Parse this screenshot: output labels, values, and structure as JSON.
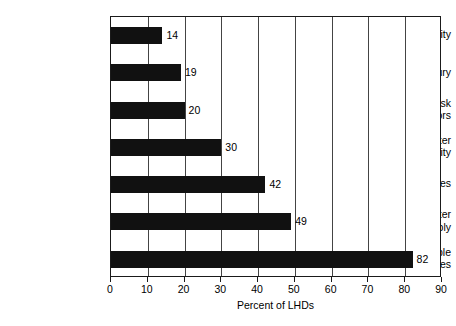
{
  "chart_data": {
    "type": "bar",
    "orientation": "horizontal",
    "title": "",
    "xlabel": "Percent of LHDs",
    "ylabel": "",
    "xlim": [
      0,
      90
    ],
    "xticks": [
      0,
      10,
      20,
      30,
      40,
      50,
      60,
      70,
      80,
      90
    ],
    "grid": "vertical",
    "legend": "none",
    "bar_color": "#111111",
    "categories": [
      "Air quality",
      "Injury",
      "Behavioral risk factors",
      "Recreational water quality",
      "Chronic diseases",
      "Drinking water supply",
      "Communicable diseases"
    ],
    "category_label_lines": [
      [
        "Air quality"
      ],
      [
        "Injury"
      ],
      [
        "Behavioral risk",
        "factors"
      ],
      [
        "Recreational water",
        "quality"
      ],
      [
        "Chronic diseases"
      ],
      [
        "Drinking water",
        "supply"
      ],
      [
        "Communicable",
        "diseases"
      ]
    ],
    "values": [
      14,
      19,
      20,
      30,
      42,
      49,
      82
    ],
    "value_labels": [
      "14",
      "19",
      "20",
      "30",
      "42",
      "49",
      "82"
    ]
  }
}
